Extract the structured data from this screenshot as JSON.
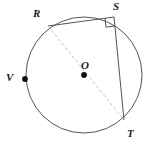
{
  "figure": {
    "type": "circle-geometry-diagram",
    "width": 161,
    "height": 149,
    "background_color": "#ffffff",
    "stroke_color": "#555555",
    "dashed_stroke_color": "#bfbfbf",
    "dot_color": "#111111",
    "label_color": "#1c1c1c"
  },
  "circle": {
    "name": "circle-O",
    "center_x": 84,
    "center_y": 75,
    "radius": 58
  },
  "points": [
    {
      "id": "R",
      "label": "R",
      "x": 48,
      "y": 26,
      "label_x": 33,
      "label_y": 8,
      "has_dot": false,
      "on_circle": true
    },
    {
      "id": "S",
      "label": "S",
      "x": 114,
      "y": 17,
      "label_x": 113,
      "label_y": 1,
      "has_dot": false,
      "on_circle": true
    },
    {
      "id": "T",
      "label": "T",
      "x": 124,
      "y": 120,
      "label_x": 127,
      "label_y": 128,
      "has_dot": false,
      "on_circle": true
    },
    {
      "id": "V",
      "label": "V",
      "x": 25,
      "y": 79,
      "label_x": 6,
      "label_y": 72,
      "has_dot": true,
      "on_circle": true
    },
    {
      "id": "O",
      "label": "O",
      "x": 84,
      "y": 75,
      "label_x": 81,
      "label_y": 60,
      "has_dot": true,
      "on_circle": false
    }
  ],
  "segments": [
    {
      "name": "chord-RS",
      "from": "R",
      "to": "S",
      "style": "solid"
    },
    {
      "name": "chord-ST",
      "from": "S",
      "to": "T",
      "style": "solid"
    },
    {
      "name": "diameter-RT",
      "from": "R",
      "to": "T",
      "style": "dashed"
    }
  ],
  "right_angle": {
    "name": "right-angle-marker-at-S",
    "vertex": "S",
    "arm_a": "R",
    "arm_b": "T",
    "size": 9
  }
}
